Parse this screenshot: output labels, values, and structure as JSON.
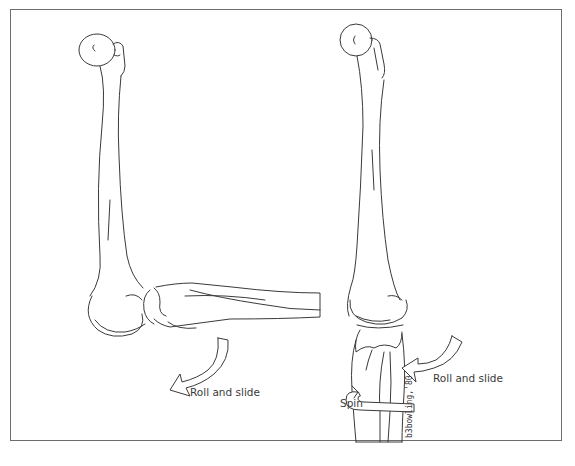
{
  "figure": {
    "panels": [
      {
        "id": "left",
        "description": "Elbow flexed ~90 degrees, humerus vertical, forearm horizontal",
        "labels": [
          {
            "text": "Roll and slide",
            "role": "motion-label"
          }
        ],
        "arrows": [
          {
            "name": "roll-and-slide-arrow",
            "direction": "curved-down-left"
          }
        ]
      },
      {
        "id": "right",
        "description": "Elbow extended, humerus and forearm aligned vertically",
        "labels": [
          {
            "text": "Roll and slide",
            "role": "motion-label"
          },
          {
            "text": "Spin",
            "role": "motion-label"
          }
        ],
        "arrows": [
          {
            "name": "roll-and-slide-arrow",
            "direction": "curved-left"
          },
          {
            "name": "spin-arrow",
            "direction": "wrap-around"
          }
        ],
        "signature": "b3bowling,'80"
      }
    ]
  },
  "colors": {
    "line": "#3a3a3a",
    "frame": "#6d6d6d",
    "background": "#ffffff"
  }
}
